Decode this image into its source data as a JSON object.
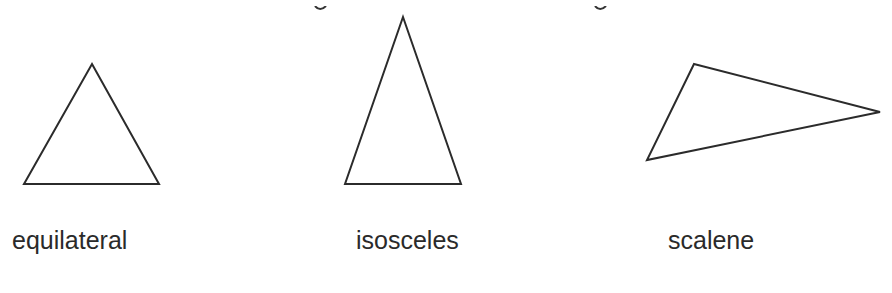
{
  "diagram": {
    "stroke_color": "#2b2b2b",
    "fill_color": "#ffffff",
    "shapes": [
      {
        "name": "equilateral",
        "points": "92,64 159,184 24,184"
      },
      {
        "name": "isosceles",
        "points": "403,17 461,184 345,184"
      },
      {
        "name": "scalene",
        "points": "694,64 880,112 647,160"
      }
    ],
    "labels": [
      {
        "text": "equilateral",
        "x": 12
      },
      {
        "text": "isosceles",
        "x": 356
      },
      {
        "text": "scalene",
        "x": 668
      }
    ]
  }
}
